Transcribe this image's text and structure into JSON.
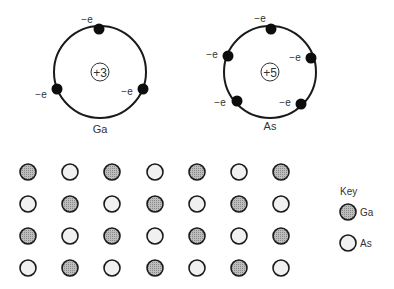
{
  "atoms": [
    {
      "id": "ga",
      "symbol": "Ga",
      "nucleus_charge": "+3",
      "electron_label": "−e",
      "electron_count": 3
    },
    {
      "id": "as",
      "symbol": "As",
      "nucleus_charge": "+5",
      "electron_label": "−e",
      "electron_count": 5
    }
  ],
  "lattice": {
    "rows": 4,
    "cols": 7,
    "pattern": [
      [
        "Ga",
        "As",
        "Ga",
        "As",
        "Ga",
        "As",
        "Ga"
      ],
      [
        "As",
        "Ga",
        "As",
        "Ga",
        "As",
        "Ga",
        "As"
      ],
      [
        "Ga",
        "As",
        "Ga",
        "As",
        "Ga",
        "As",
        "Ga"
      ],
      [
        "As",
        "Ga",
        "As",
        "Ga",
        "As",
        "Ga",
        "As"
      ]
    ]
  },
  "key": {
    "title": "Key",
    "items": [
      {
        "label": "Ga",
        "fill": "#a8a8a8"
      },
      {
        "label": "As",
        "fill": "#f0f0f0"
      }
    ]
  },
  "colors": {
    "stroke": "#1a1a1a",
    "electron": "#0d0d0d",
    "ga_fill": "#a8a8a8",
    "as_fill": "#f0f0f0"
  }
}
